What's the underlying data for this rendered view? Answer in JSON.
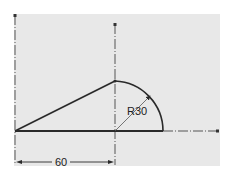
{
  "drawing": {
    "type": "technical-sketch",
    "dimensions": {
      "horizontal_label": "60",
      "radius_label": "R30"
    },
    "colors": {
      "background": "#ffffff",
      "panel": "#e8e8e8",
      "line": "#2a2a2a",
      "centerline": "#555555"
    }
  }
}
